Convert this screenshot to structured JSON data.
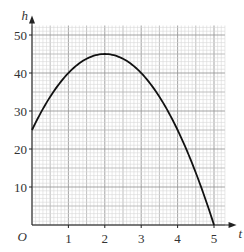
{
  "chart_data": {
    "type": "line",
    "title": "",
    "xlabel": "t",
    "ylabel": "h",
    "origin_label": "O",
    "x_ticks": [
      1,
      2,
      3,
      4,
      5
    ],
    "y_ticks": [
      10,
      20,
      30,
      40,
      50
    ],
    "xlim": [
      0,
      5.4
    ],
    "ylim": [
      0,
      53
    ],
    "grid": true,
    "series": [
      {
        "name": "h = 25 + 20t - 5t^2",
        "x": [
          0,
          0.5,
          1,
          1.5,
          2,
          2.5,
          3,
          3.5,
          4,
          4.5,
          5
        ],
        "y": [
          25,
          33.75,
          40,
          43.75,
          45,
          43.75,
          40,
          33.75,
          25,
          13.75,
          0
        ]
      }
    ]
  }
}
